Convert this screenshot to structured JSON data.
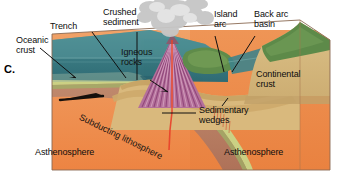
{
  "figure": {
    "panel_letter": "C.",
    "type": "geologic block diagram"
  },
  "labels": {
    "oceanic_crust": "Oceanic\ncrust",
    "trench": "Trench",
    "crushed_sediment": "Crushed\nsediment",
    "igneous_rocks": "Igneous\nrocks",
    "island_arc": "Island\narc",
    "back_arc_basin": "Back arc\nbasin",
    "continental_crust": "Continental\ncrust",
    "sedimentary_wedges": "Sedimentary\nwedges",
    "subducting_lithosphere": "Subducting lithosphere",
    "asthenosphere_left": "Asthenosphere",
    "asthenosphere_right": "Asthenosphere"
  },
  "label_lines": [
    {
      "name": "oceanic-crust-leader"
    },
    {
      "name": "trench-leader"
    },
    {
      "name": "crushed-sediment-leader"
    },
    {
      "name": "igneous-rocks-leader"
    },
    {
      "name": "island-arc-leader"
    },
    {
      "name": "back-arc-basin-leader"
    },
    {
      "name": "sedimentary-wedges-leader"
    }
  ],
  "features": {
    "volcano": "erupting stratovolcano with ash plume",
    "ash_plume": "grey volcanic ash cloud",
    "magma_conduit": "red magma conduit rising from slab",
    "plate_motion_arrow": "arrow showing oceanic plate moving right",
    "island_landmass": "green vegetated volcanic island",
    "continent_landmass": "green vegetated continental margin"
  },
  "colors": {
    "ocean_water": "#3c7f86",
    "ocean_water_light": "#5aa0a4",
    "sky": "#ffffff",
    "ash_plume": "#c9c9c9",
    "oceanic_crust_band": "#c9cf7e",
    "lithosphere": "#b57a62",
    "asthenosphere": "#ef8c4a",
    "asthenosphere_light": "#f2a066",
    "continental_crust": "#d6b878",
    "vegetation": "#5f8b4a",
    "volcano_stripes_dark": "#9c4f84",
    "volcano_stripes_light": "#d9a3c4",
    "magma_red": "#e8412a",
    "label_text": "#0d0d0d",
    "background": "#ffffff"
  }
}
